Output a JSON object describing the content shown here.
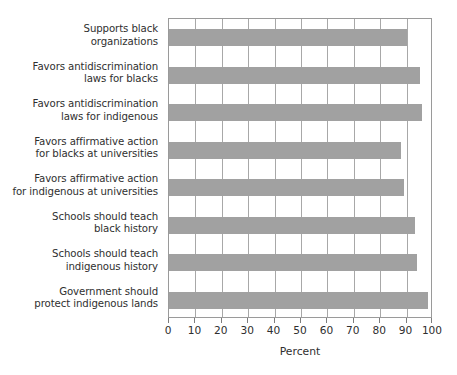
{
  "chart_data": {
    "type": "bar",
    "orientation": "horizontal",
    "title": "",
    "xlabel": "Percent",
    "ylabel": "",
    "xlim": [
      0,
      100
    ],
    "xticks": [
      0,
      10,
      20,
      30,
      40,
      50,
      60,
      70,
      80,
      90,
      100
    ],
    "grid": "vertical",
    "legend": "none",
    "bar_color": "#a1a1a1",
    "categories": [
      "Supports black organizations",
      "Favors antidiscrimination laws for blacks",
      "Favors antidiscrimination laws for indigenous",
      "Favors affirmative action for blacks at universities",
      "Favors affirmative action for indigenous at universities",
      "Schools should teach black history",
      "Schools should teach indigenous history",
      "Government should protect indigenous lands"
    ],
    "category_lines": [
      [
        "Supports black",
        "organizations"
      ],
      [
        "Favors antidiscrimination",
        "laws for blacks"
      ],
      [
        "Favors antidiscrimination",
        "laws for indigenous"
      ],
      [
        "Favors affirmative action",
        "for blacks at universities"
      ],
      [
        "Favors affirmative action",
        "for indigenous at universities"
      ],
      [
        "Schools should teach",
        "black history"
      ],
      [
        "Schools should teach",
        "indigenous history"
      ],
      [
        "Government should",
        "protect indigenous lands"
      ]
    ],
    "values": [
      90,
      95,
      96,
      88,
      89,
      93,
      94,
      98
    ]
  }
}
